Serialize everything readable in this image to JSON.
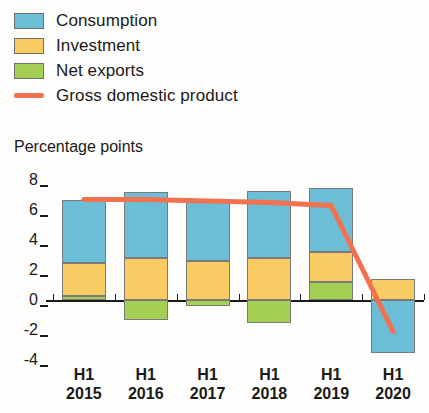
{
  "legend": {
    "items": [
      {
        "label": "Consumption",
        "color": "#6CBDD6",
        "marker": "box"
      },
      {
        "label": "Investment",
        "color": "#F8CC62",
        "marker": "box"
      },
      {
        "label": "Net exports",
        "color": "#A5CE54",
        "marker": "box"
      },
      {
        "label": "Gross domestic product",
        "color": "#F2714E",
        "marker": "line"
      }
    ]
  },
  "axis_title": "Percentage points",
  "chart_data": {
    "type": "bar",
    "title": "",
    "subtitle": "",
    "xlabel": "",
    "ylabel": "Percentage points",
    "categories": [
      "H1 2015",
      "H1 2016",
      "H1 2017",
      "H1 2018",
      "H1 2019",
      "H1 2020"
    ],
    "category_lines": [
      [
        "H1",
        "2015"
      ],
      [
        "H1",
        "2016"
      ],
      [
        "H1",
        "2017"
      ],
      [
        "H1",
        "2018"
      ],
      [
        "H1",
        "2019"
      ],
      [
        "H1",
        "2020"
      ]
    ],
    "ylim": [
      -4.6,
      8.6
    ],
    "yticks": [
      8,
      6,
      4,
      2,
      0,
      -2,
      -4
    ],
    "ytick_labels": [
      "8",
      "6",
      "4",
      "2",
      "0",
      "-2",
      "-4"
    ],
    "grid": false,
    "stacked": true,
    "legend_position": "top-left",
    "series": [
      {
        "name": "Consumption",
        "color": "#6CBDD6",
        "values": [
          4.2,
          4.4,
          4.0,
          4.5,
          4.3,
          -3.5
        ]
      },
      {
        "name": "Investment",
        "color": "#F8CC62",
        "values": [
          2.2,
          2.8,
          2.6,
          2.8,
          2.0,
          1.4
        ]
      },
      {
        "name": "Net exports",
        "color": "#A5CE54",
        "values": [
          0.3,
          -1.3,
          -0.4,
          -1.5,
          1.2,
          0.0
        ]
      }
    ],
    "line_series": {
      "name": "Gross domestic product",
      "color": "#F2714E",
      "values": [
        6.7,
        6.7,
        6.6,
        6.5,
        6.3,
        -2.1
      ]
    }
  }
}
